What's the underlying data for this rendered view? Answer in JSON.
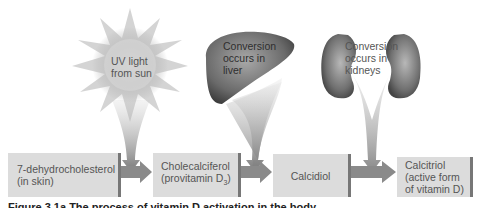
{
  "sources": {
    "sun": {
      "line1": "UV light",
      "line2": "from sun",
      "icon": "sun-icon"
    },
    "liver": {
      "line1": "Conversion",
      "line2": "occurs in",
      "line3": "liver",
      "icon": "liver-icon"
    },
    "kidneys": {
      "line1": "Conversion",
      "line2": "occurs in",
      "line3": "kidneys",
      "icon": "kidneys-icon"
    }
  },
  "pathway": [
    {
      "line1": "7-dehydrocholesterol",
      "line2": "(in skin)"
    },
    {
      "line1": "Cholecalciferol",
      "line2_prefix": "(provitamin D",
      "line2_sub": "3",
      "line2_suffix": ")"
    },
    {
      "line1": "Calcidiol"
    },
    {
      "line1": "Calcitriol",
      "line2": "(active form",
      "line3": "of vitamin D)"
    }
  ],
  "caption": "Figure 3.1a    The process of vitamin D activation in the body",
  "colors": {
    "box_fill": "#dcdcdc",
    "box_edge": "#777777",
    "arrow": "#8a8a8a",
    "organ": "#6e6e6e"
  }
}
